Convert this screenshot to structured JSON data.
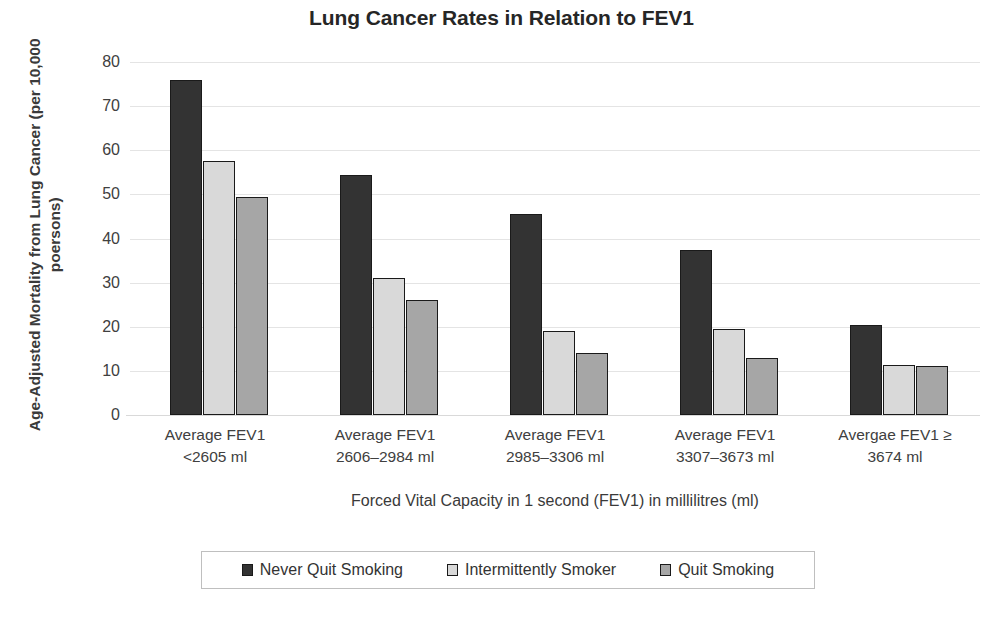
{
  "chart_data": {
    "type": "bar",
    "title": "Lung Cancer Rates in Relation to FEV1",
    "xlabel": "Forced Vital Capacity in 1 second (FEV1) in millilitres (ml)",
    "ylabel": "Age-Adjusted Mortality from Lung Cancer (per 10,000 poersons)",
    "categories": [
      "Average FEV1 <2605 ml",
      "Average FEV1 2606–2984 ml",
      "Average FEV1 2985–3306 ml",
      "Average FEV1 3307–3673 ml",
      "Avergae FEV1 ≥ 3674 ml"
    ],
    "category_lines": [
      [
        "Average FEV1",
        "<2605 ml"
      ],
      [
        "Average FEV1",
        "2606–2984 ml"
      ],
      [
        "Average FEV1",
        "2985–3306 ml"
      ],
      [
        "Average FEV1",
        "3307–3673 ml"
      ],
      [
        "Avergae FEV1 ≥",
        "3674 ml"
      ]
    ],
    "series": [
      {
        "name": "Never Quit Smoking",
        "color": "#333333",
        "values": [
          76.0,
          54.5,
          45.5,
          37.5,
          20.5
        ]
      },
      {
        "name": "Intermittently Smoker",
        "color": "#d9d9d9",
        "values": [
          57.5,
          31.0,
          19.0,
          19.5,
          11.3
        ]
      },
      {
        "name": "Quit Smoking",
        "color": "#a6a6a6",
        "values": [
          49.5,
          26.0,
          14.0,
          13.0,
          11.2
        ]
      }
    ],
    "ylim": [
      0,
      80
    ],
    "yticks": [
      80,
      70,
      60,
      50,
      40,
      30,
      20,
      10,
      0
    ],
    "ytick_labels": [
      "80",
      "70",
      "60",
      "50",
      "40",
      "30",
      "20",
      "10",
      "0"
    ],
    "grid": true,
    "legend_position": "bottom"
  }
}
